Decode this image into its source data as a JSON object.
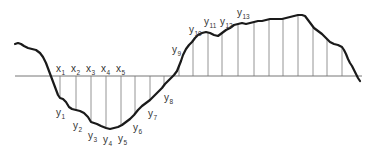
{
  "diagram": {
    "type": "curve-with-ordinates",
    "colors": {
      "curve": "#1a1a1a",
      "axis": "#777777",
      "ordinate": "#888888",
      "text": "#333333"
    },
    "x_labels": [
      {
        "base": "x",
        "sub": "1",
        "x": 56,
        "y": 72
      },
      {
        "base": "x",
        "sub": "2",
        "x": 71,
        "y": 72
      },
      {
        "base": "x",
        "sub": "3",
        "x": 86,
        "y": 72
      },
      {
        "base": "x",
        "sub": "4",
        "x": 101,
        "y": 72
      },
      {
        "base": "x",
        "sub": "5",
        "x": 116,
        "y": 72
      }
    ],
    "y_labels": [
      {
        "base": "y",
        "sub": "1",
        "x": 56,
        "y": 116
      },
      {
        "base": "y",
        "sub": "2",
        "x": 73,
        "y": 129
      },
      {
        "base": "y",
        "sub": "3",
        "x": 88,
        "y": 139
      },
      {
        "base": "y",
        "sub": "4",
        "x": 103,
        "y": 143
      },
      {
        "base": "y",
        "sub": "5",
        "x": 118,
        "y": 142
      },
      {
        "base": "y",
        "sub": "6",
        "x": 133,
        "y": 131
      },
      {
        "base": "y",
        "sub": "7",
        "x": 148,
        "y": 117
      },
      {
        "base": "y",
        "sub": "8",
        "x": 164,
        "y": 101
      },
      {
        "base": "y",
        "sub": "9",
        "x": 172,
        "y": 53
      },
      {
        "base": "y",
        "sub": "10",
        "x": 189,
        "y": 33
      },
      {
        "base": "y",
        "sub": "11",
        "x": 204,
        "y": 25
      },
      {
        "base": "y",
        "sub": "12",
        "x": 220,
        "y": 25
      },
      {
        "base": "y",
        "sub": "13",
        "x": 237,
        "y": 16
      }
    ],
    "axis": {
      "x1": 15,
      "x2": 362,
      "y": 76
    },
    "ordinates_x": [
      60,
      76,
      91,
      106,
      121,
      135,
      150,
      164,
      179,
      193,
      208,
      222,
      238,
      254,
      269,
      283,
      298,
      313,
      327,
      342
    ]
  }
}
